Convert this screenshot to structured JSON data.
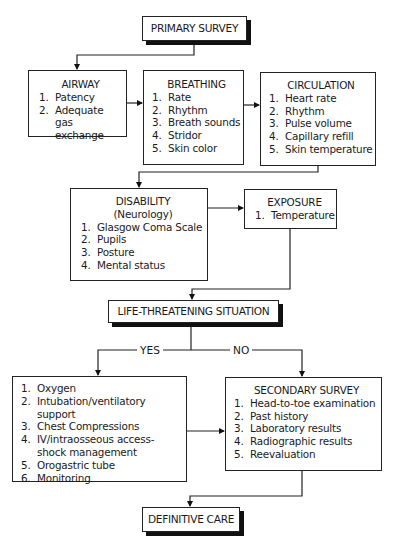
{
  "diagram": {
    "primary_survey": {
      "title": "PRIMARY SURVEY"
    },
    "airway": {
      "title": "AIRWAY",
      "items": [
        {
          "n": "1.",
          "t": "Patency"
        },
        {
          "n": "2.",
          "t": "Adequate gas exchange"
        }
      ]
    },
    "breathing": {
      "title": "BREATHING",
      "items": [
        {
          "n": "1.",
          "t": "Rate"
        },
        {
          "n": "2.",
          "t": "Rhythm"
        },
        {
          "n": "3.",
          "t": "Breath sounds"
        },
        {
          "n": "4.",
          "t": "Stridor"
        },
        {
          "n": "5.",
          "t": "Skin color"
        }
      ]
    },
    "circulation": {
      "title": "CIRCULATION",
      "items": [
        {
          "n": "1.",
          "t": "Heart rate"
        },
        {
          "n": "2.",
          "t": "Rhythm"
        },
        {
          "n": "3.",
          "t": "Pulse volume"
        },
        {
          "n": "4.",
          "t": "Capillary refill"
        },
        {
          "n": "5.",
          "t": "Skin temperature"
        }
      ]
    },
    "disability": {
      "title": "DISABILITY",
      "subtitle": "(Neurology)",
      "items": [
        {
          "n": "1.",
          "t": "Glasgow Coma Scale"
        },
        {
          "n": "2.",
          "t": "Pupils"
        },
        {
          "n": "3.",
          "t": "Posture"
        },
        {
          "n": "4.",
          "t": "Mental status"
        }
      ]
    },
    "exposure": {
      "title": "EXPOSURE",
      "items": [
        {
          "n": "1.",
          "t": "Temperature"
        }
      ]
    },
    "life_threatening": {
      "title": "LIFE-THREATENING SITUATION"
    },
    "branch_labels": {
      "yes": "YES",
      "no": "NO"
    },
    "interventions": {
      "items": [
        {
          "n": "1.",
          "t": "Oxygen"
        },
        {
          "n": "2.",
          "t": "Intubation/ventilatory support"
        },
        {
          "n": "3.",
          "t": "Chest Compressions"
        },
        {
          "n": "4.",
          "t": "IV/intraosseous access-shock management"
        },
        {
          "n": "5.",
          "t": "Orogastric tube"
        },
        {
          "n": "6.",
          "t": "Monitoring"
        }
      ]
    },
    "secondary_survey": {
      "title": "SECONDARY SURVEY",
      "items": [
        {
          "n": "1.",
          "t": "Head-to-toe examination"
        },
        {
          "n": "2.",
          "t": "Past history"
        },
        {
          "n": "3.",
          "t": "Laboratory results"
        },
        {
          "n": "4.",
          "t": "Radiographic results"
        },
        {
          "n": "5.",
          "t": "Reevaluation"
        }
      ]
    },
    "definitive_care": {
      "title": "DEFINITIVE CARE"
    }
  }
}
